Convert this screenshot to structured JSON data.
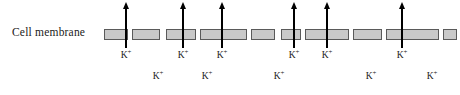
{
  "diagram": {
    "membrane_label": "Cell membrane",
    "ion_symbol": "K",
    "ion_charge": "+",
    "colors": {
      "membrane_fill": "#c9c9c9",
      "membrane_border": "#5a5a5a",
      "arrow": "#000000",
      "text": "#1a1a1a",
      "background": "#ffffff"
    },
    "membrane_segments": [
      {
        "x": 104,
        "width": 24
      },
      {
        "x": 132,
        "width": 28
      },
      {
        "x": 166,
        "width": 30
      },
      {
        "x": 200,
        "width": 47
      },
      {
        "x": 251,
        "width": 24
      },
      {
        "x": 281,
        "width": 20
      },
      {
        "x": 305,
        "width": 44
      },
      {
        "x": 353,
        "width": 29
      },
      {
        "x": 386,
        "width": 53
      },
      {
        "x": 443,
        "width": 14
      },
      {
        "x": 461,
        "width": 36
      }
    ],
    "arrows": [
      {
        "x": 126,
        "top": 8,
        "bottom": 48
      },
      {
        "x": 183,
        "top": 8,
        "bottom": 48
      },
      {
        "x": 222,
        "top": 8,
        "bottom": 48
      },
      {
        "x": 294,
        "top": 8,
        "bottom": 48
      },
      {
        "x": 327,
        "top": 8,
        "bottom": 48
      },
      {
        "x": 402,
        "top": 8,
        "bottom": 48
      }
    ],
    "ion_labels_upper": [
      {
        "x": 126,
        "y": 50
      },
      {
        "x": 183,
        "y": 50
      },
      {
        "x": 222,
        "y": 50
      },
      {
        "x": 294,
        "y": 50
      },
      {
        "x": 327,
        "y": 50
      },
      {
        "x": 402,
        "y": 50
      }
    ],
    "ion_labels_lower": [
      {
        "x": 158,
        "y": 71
      },
      {
        "x": 207,
        "y": 71
      },
      {
        "x": 279,
        "y": 71
      },
      {
        "x": 371,
        "y": 71
      },
      {
        "x": 432,
        "y": 71
      }
    ]
  }
}
